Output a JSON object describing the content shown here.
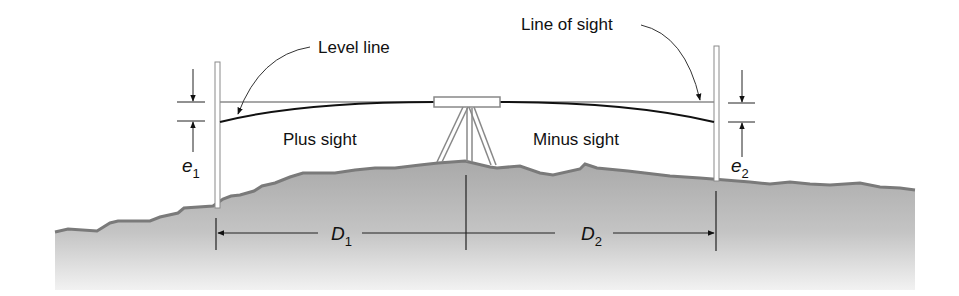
{
  "diagram": {
    "labels": {
      "level_line": "Level line",
      "line_of_sight": "Line of sight",
      "plus_sight": "Plus sight",
      "minus_sight": "Minus sight"
    },
    "symbols": {
      "e1": {
        "base": "e",
        "sub": "1"
      },
      "e2": {
        "base": "e",
        "sub": "2"
      },
      "d1": {
        "base": "D",
        "sub": "1"
      },
      "d2": {
        "base": "D",
        "sub": "2"
      }
    },
    "colors": {
      "ground_top": "#a8a8a8",
      "ground_bottom": "#f0f0f0",
      "ground_edge": "#7a7a7a",
      "line": "#111111",
      "instrument": "#888888"
    }
  }
}
